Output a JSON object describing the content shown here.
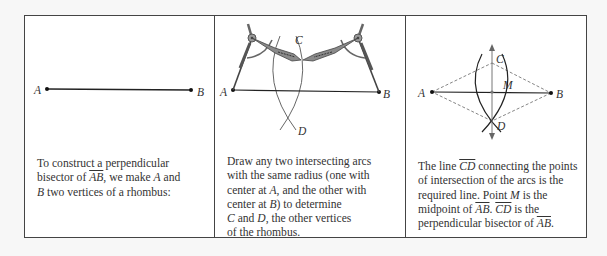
{
  "panels": [
    {
      "labels": {
        "A": "A",
        "B": "B"
      },
      "caption": {
        "l1": "To construct a perpendicular",
        "l2a": "bisector of ",
        "seg": "AB",
        "l2b": ",  we make ",
        "A": "A",
        "l2c": " and",
        "B": "B",
        "l3": " two vertices of a rhombus:"
      }
    },
    {
      "labels": {
        "A": "A",
        "B": "B",
        "C": "C",
        "D": "D"
      },
      "caption": {
        "l1": "Draw any two intersecting arcs",
        "l2": "with the same radius (one with",
        "l3a": "center at ",
        "A": "A",
        "l3b": ", and the other with",
        "l4a": "center at ",
        "B": "B",
        "l4b": ") to determine",
        "C": "C",
        "l5a": "  and ",
        "D": "D",
        "l5b": ", the other vertices",
        "l6": "of the rhombus."
      }
    },
    {
      "labels": {
        "A": "A",
        "B": "B",
        "C": "C",
        "D": "D",
        "M": "M"
      },
      "caption": {
        "l1a": "The line ",
        "line": "CD",
        "l1b": " connecting the points",
        "l2": "of intersection of the arcs is the",
        "l3a": "required line. Point ",
        "M": "M",
        "l3b": "  is the",
        "l4a": "midpoint of ",
        "seg1": "AB",
        "l4b": ". ",
        "line2": "CD",
        "l4c": " is the",
        "l5a": "perpendicular bisector of ",
        "seg2": "AB",
        "l5b": "."
      }
    }
  ]
}
